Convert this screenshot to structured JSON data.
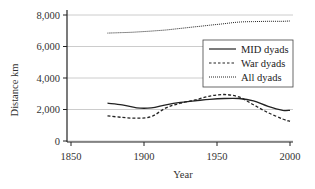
{
  "chart_data": {
    "type": "line",
    "title": "",
    "xlabel": "Year",
    "ylabel": "Distance km",
    "xlim": [
      1850,
      2000
    ],
    "ylim": [
      0,
      8000
    ],
    "x_ticks": [
      1850,
      1900,
      1950,
      2000
    ],
    "x_tick_labels": [
      "1850",
      "1900",
      "1950",
      "2000"
    ],
    "y_ticks": [
      0,
      2000,
      4000,
      6000,
      8000
    ],
    "y_tick_labels": [
      "0",
      "2,000",
      "4,000",
      "6,000",
      "8,000"
    ],
    "grid": "horizontal",
    "legend_position": "right-middle",
    "x": [
      1875,
      1885,
      1895,
      1905,
      1915,
      1925,
      1935,
      1945,
      1955,
      1965,
      1975,
      1985,
      1995,
      2000
    ],
    "series": [
      {
        "name": "MID dyads",
        "style": "solid",
        "values": [
          2400,
          2300,
          2100,
          2100,
          2300,
          2450,
          2550,
          2650,
          2700,
          2700,
          2550,
          2200,
          1950,
          1950
        ]
      },
      {
        "name": "War dyads",
        "style": "dashed",
        "values": [
          1600,
          1500,
          1450,
          1550,
          2100,
          2400,
          2600,
          2850,
          2950,
          2800,
          2300,
          1800,
          1400,
          1250
        ]
      },
      {
        "name": "All dyads",
        "style": "dotted",
        "values": [
          6850,
          6880,
          6920,
          6980,
          7050,
          7150,
          7250,
          7350,
          7450,
          7550,
          7580,
          7600,
          7600,
          7620
        ]
      }
    ]
  },
  "legend": {
    "items": [
      {
        "label": "MID dyads",
        "style": "solid"
      },
      {
        "label": "War dyads",
        "style": "dashed"
      },
      {
        "label": "All dyads",
        "style": "dotted"
      }
    ]
  },
  "colors": {
    "line": "#222222",
    "grid": "#cccccc",
    "axis": "#222222",
    "background": "#ffffff"
  }
}
